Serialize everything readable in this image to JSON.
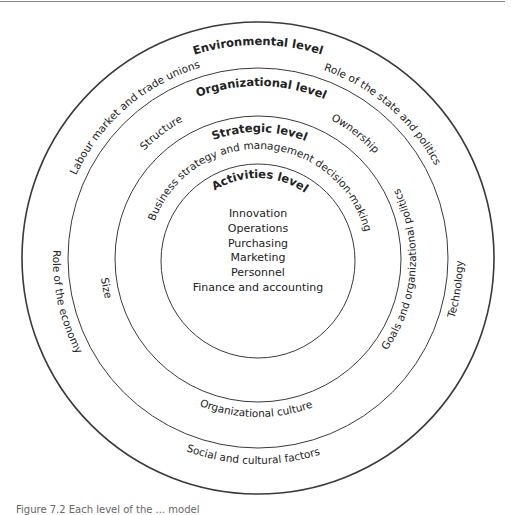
{
  "diagram": {
    "type": "concentric-levels",
    "levels": [
      {
        "name": "Environmental level",
        "items": [
          "Labour market and trade unions",
          "Role of the state and politics",
          "Technology",
          "Social and cultural factors",
          "Role of the economy"
        ]
      },
      {
        "name": "Organizational level",
        "items": [
          "Structure",
          "Ownership",
          "Goals and organizational politics",
          "Organizational culture",
          "Size"
        ]
      },
      {
        "name": "Strategic level",
        "items": [
          "Business strategy and management decision-making"
        ]
      },
      {
        "name": "Activities level",
        "items": [
          "Innovation",
          "Operations",
          "Purchasing",
          "Marketing",
          "Personnel",
          "Finance and accounting"
        ]
      }
    ]
  },
  "labels": {
    "environmental_level": "Environmental level",
    "labour_market": "Labour market and trade unions",
    "role_of_state": "Role of the state and politics",
    "organizational_level": "Organizational level",
    "structure": "Structure",
    "ownership": "Ownership",
    "strategic_level": "Strategic level",
    "business_strategy": "Business strategy and management decision-making",
    "activities_level": "Activities level",
    "role_of_economy": "Role of the economy",
    "size": "Size",
    "goals_politics": "Goals and organizational politics",
    "technology": "Technology",
    "organizational_culture": "Organizational culture",
    "social_cultural": "Social and cultural factors"
  },
  "activities": [
    "Innovation",
    "Operations",
    "Purchasing",
    "Marketing",
    "Personnel",
    "Finance and accounting"
  ],
  "caption": "Figure 7.2  Each level of the ... model"
}
